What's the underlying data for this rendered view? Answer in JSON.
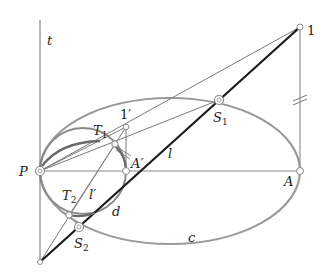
{
  "diagram": {
    "labels": {
      "t": "t",
      "one": "1",
      "one_prime": "1′",
      "T1": "T",
      "T1_sub": "1",
      "S1": "S",
      "S1_sub": "1",
      "P": "P",
      "A_prime": "A′",
      "l": "l",
      "A": "A",
      "T2": "T",
      "T2_sub": "2",
      "l_prime": "l′",
      "d": "d",
      "S2": "S",
      "S2_sub": "2",
      "c": "c"
    },
    "colors": {
      "ellipse": "#9a9a9a",
      "thin_line": "#7a7a7a",
      "thick_line": "#1a1a1a",
      "arc": "#6a6a6a",
      "text": "#222222"
    }
  }
}
